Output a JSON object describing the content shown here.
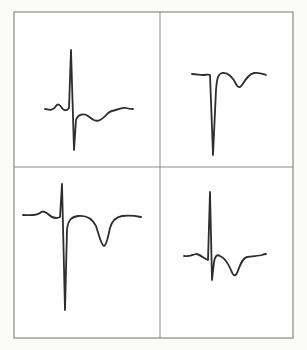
{
  "figure": {
    "frame": {
      "x": 14,
      "y": 12,
      "width": 279,
      "height": 326
    },
    "divider": {
      "vertical_x": 160,
      "horizontal_y": 167
    },
    "colors": {
      "background": "#fbfbfa",
      "panel_background": "#ffffff",
      "border": "#8a8a8a",
      "trace": "#2e2e2e"
    },
    "panels": [
      {
        "id": "top-left",
        "description": "ECG complex: small P wave, tall R wave, deep S wave, shallow inverted T wave",
        "path": "M45,109 C50,110 53,111 56,106 C58,103 60,105 62,108 C64,111 67,111 69,108 L71,50 L74,150 L76,120 C78,114 84,113 88,116 C93,120 96,122 100,120 C105,118 107,112 112,111 C118,110 122,107 126,108 C129,109 131,109 133,109"
      },
      {
        "id": "top-right",
        "description": "ECG complex: deep QS wave with inverted T wave",
        "path": "M192,74 C197,74 199,75 203,75 C206,75 208,74 210,75 L213,155 L216,90 C217,78 218,74 222,73 C228,72 233,78 236,84 C238,88 240,88 242,85 C245,80 249,74 254,73 C259,72 263,74 266,75"
      },
      {
        "id": "bottom-left",
        "description": "ECG complex: small P wave, tall R wave, very deep S wave, deep inverted T wave",
        "path": "M23,215 C30,215 36,216 40,213 C43,210 45,212 48,214 C52,218 56,219 60,217 L62,184 L65,310 L67,230 C68,219 72,217 78,216 C86,215 92,218 96,226 C99,235 101,245 104,246 C107,245 108,236 110,228 C112,221 116,217 122,216 C130,215 136,216 141,217"
      },
      {
        "id": "bottom-right",
        "description": "ECG complex: small P wave, tall R wave, small S wave, inverted T wave",
        "path": "M184,256 C189,257 192,255 196,254 C200,254 204,259 208,260 L210,192 L212,280 L214,262 C215,256 217,254 220,256 C225,258 228,263 231,270 C233,276 235,277 237,273 C240,266 242,258 247,257 C253,256 259,256 262,255 C264,254 265,254 266,254"
      }
    ]
  }
}
